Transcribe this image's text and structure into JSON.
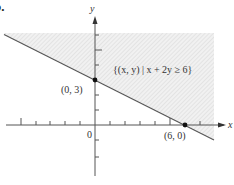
{
  "panel_label": "b.",
  "axes": {
    "x_label": "x",
    "y_label": "y",
    "origin_label": "0"
  },
  "points": [
    {
      "label": "(0, 3)",
      "x": 0,
      "y": 3
    },
    {
      "label": "(6, 0)",
      "x": 6,
      "y": 0
    }
  ],
  "region_label": "{(x, y) | x + 2y ≥ 6}",
  "line": {
    "equation": "x + 2y = 6"
  },
  "colors": {
    "axis": "#444444",
    "line": "#555555",
    "shade": "#d8d8d8",
    "point": "#111111"
  }
}
